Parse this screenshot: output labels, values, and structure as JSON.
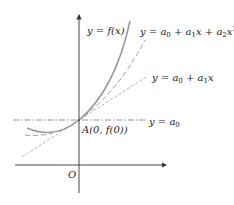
{
  "diagram": {
    "labels": {
      "curve": "y = f(x)",
      "quadratic_prefix": "y = a",
      "linear_prefix": "y = a",
      "constant_prefix": "y = a",
      "point": "A(0, f(0))",
      "origin": "O"
    },
    "curves": [
      {
        "name": "y = f(x)",
        "style": "solid",
        "color": "#9a9a9a"
      },
      {
        "name": "y = a0 + a1x + a2x^2",
        "style": "dashed",
        "color": "#9a9a9a"
      },
      {
        "name": "y = a0 + a1x",
        "style": "dashed",
        "color": "#a8a8a8"
      },
      {
        "name": "y = a0",
        "style": "dash-dot",
        "color": "#8a8a8a"
      }
    ],
    "colors": {
      "axis": "#333333",
      "curve": "#9a9a9a",
      "text": "#222222"
    }
  }
}
